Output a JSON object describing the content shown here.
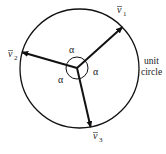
{
  "diagram": {
    "type": "unit-circle-vectors",
    "vectors": [
      {
        "label": "v̄₁",
        "base": "v",
        "subscript": "1",
        "angle_deg": 42
      },
      {
        "label": "v̄₂",
        "base": "v",
        "subscript": "2",
        "angle_deg": 164
      },
      {
        "label": "v̄₃",
        "base": "v",
        "subscript": "3",
        "angle_deg": 283
      }
    ],
    "angle_label": "α",
    "angle_labels": [
      "α",
      "α",
      "α"
    ],
    "circle_label_line1": "unit",
    "circle_label_line2": "circle",
    "colors": {
      "stroke": "#111111",
      "text": "#222222",
      "background": "#ffffff"
    }
  }
}
